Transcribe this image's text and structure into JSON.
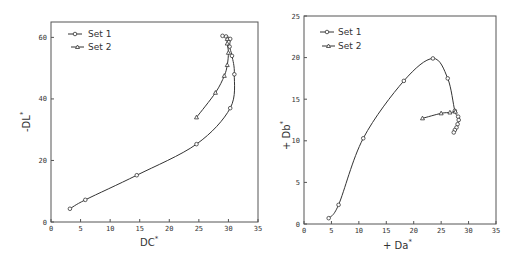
{
  "chart_data": [
    {
      "type": "line",
      "title": "",
      "xlabel": "DC*",
      "ylabel": "-DL*",
      "xlim": [
        0,
        35
      ],
      "ylim": [
        0,
        65
      ],
      "xticks": [
        0,
        5,
        10,
        15,
        20,
        25,
        30,
        35
      ],
      "yticks": [
        0,
        20,
        40,
        60
      ],
      "grid": false,
      "legend_position": "upper-left",
      "series": [
        {
          "name": "Set 1",
          "marker": "circle",
          "x": [
            3.2,
            5.8,
            14.5,
            24.6,
            30.3,
            31.0,
            30.6,
            30.2,
            30.3,
            29.6,
            29.0
          ],
          "y": [
            4.3,
            7.2,
            15.2,
            25.3,
            37.0,
            48.0,
            54.0,
            57.0,
            59.5,
            60.3,
            60.5
          ]
        },
        {
          "name": "Set 2",
          "marker": "triangle",
          "x": [
            24.6,
            27.8,
            29.3,
            29.8,
            30.0,
            29.8,
            29.8
          ],
          "y": [
            34.0,
            42.0,
            47.5,
            51.0,
            55.0,
            58.0,
            59.5
          ]
        }
      ]
    },
    {
      "type": "line",
      "title": "",
      "xlabel": "+ Da*",
      "ylabel": "+ Db*",
      "xlim": [
        0,
        35
      ],
      "ylim": [
        0,
        25
      ],
      "xticks": [
        0,
        5,
        10,
        15,
        20,
        25,
        30,
        35
      ],
      "yticks": [
        0,
        5,
        10,
        15,
        20,
        25
      ],
      "grid": false,
      "legend_position": "upper-left",
      "series": [
        {
          "name": "Set 1",
          "marker": "circle",
          "x": [
            4.5,
            6.3,
            10.8,
            18.2,
            23.5,
            26.2,
            27.5,
            28.1,
            28.2,
            28.0,
            27.8,
            27.5,
            27.3
          ],
          "y": [
            0.7,
            2.3,
            10.3,
            17.2,
            19.9,
            17.5,
            13.6,
            12.9,
            12.5,
            12.0,
            11.6,
            11.3,
            11.0
          ]
        },
        {
          "name": "Set 2",
          "marker": "triangle",
          "x": [
            21.6,
            25.0,
            26.6,
            27.6
          ],
          "y": [
            12.7,
            13.3,
            13.4,
            13.5
          ]
        }
      ]
    }
  ],
  "charts": {
    "left": {
      "xlabel": "DC",
      "xlabel_sup": "*",
      "ylabel": "-DL",
      "ylabel_sup": "*",
      "legend": [
        "Set 1",
        "Set 2"
      ]
    },
    "right": {
      "xlabel": "+ Da",
      "xlabel_sup": "*",
      "ylabel": "+ Db",
      "ylabel_sup": "*",
      "legend": [
        "Set 1",
        "Set 2"
      ]
    }
  }
}
